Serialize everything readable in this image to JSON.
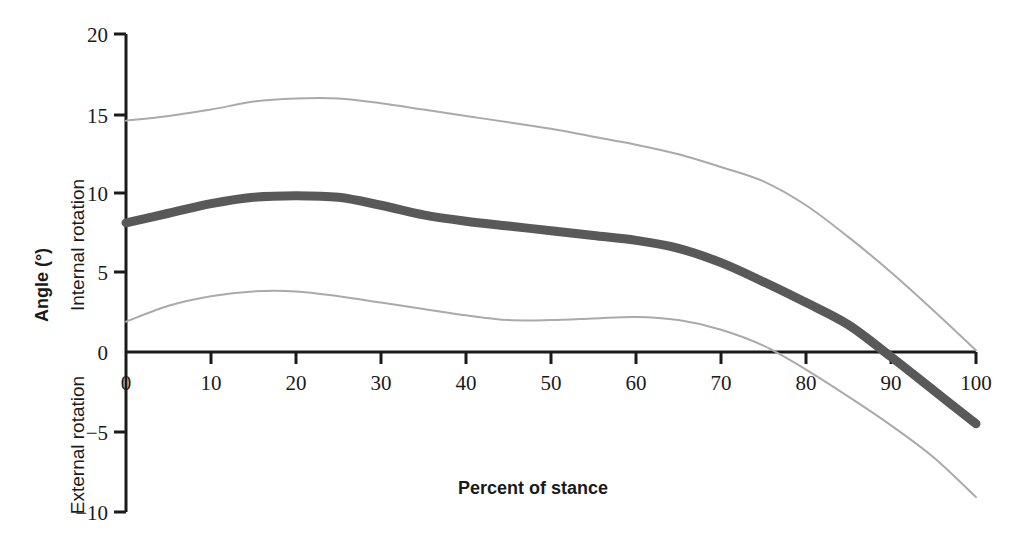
{
  "chart_data": {
    "type": "line",
    "title": "",
    "xlabel": "Percent of stance",
    "ylabel": "Angle (°)",
    "y_upper_region_label": "Internal rotation",
    "y_lower_region_label": "External rotation",
    "xlim": [
      0,
      100
    ],
    "ylim": [
      -10,
      20
    ],
    "xticks": [
      0,
      10,
      20,
      30,
      40,
      50,
      60,
      70,
      80,
      90,
      100
    ],
    "xtick_labels": [
      "0",
      "10",
      "20",
      "30",
      "40",
      "50",
      "60",
      "70",
      "80",
      "90",
      "100"
    ],
    "yticks": [
      -10,
      -5,
      0,
      5,
      10,
      15,
      20
    ],
    "ytick_labels": [
      "−10",
      "−5",
      "0",
      "5",
      "10",
      "15",
      "20"
    ],
    "grid": false,
    "legend": "none",
    "zero_line": true,
    "colors": {
      "mean": "#595959",
      "band": "#aaaaaa",
      "axis": "#1a1a1a"
    },
    "x": [
      0,
      5,
      10,
      15,
      20,
      25,
      30,
      35,
      40,
      45,
      50,
      55,
      60,
      65,
      70,
      75,
      80,
      85,
      90,
      95,
      100
    ],
    "series": [
      {
        "name": "Mean + 1 SD",
        "style": "thin",
        "color": "#aaaaaa",
        "values": [
          14.5,
          14.8,
          15.2,
          15.7,
          15.9,
          15.9,
          15.6,
          15.2,
          14.8,
          14.4,
          14.0,
          13.5,
          13.0,
          12.4,
          11.6,
          10.7,
          9.2,
          7.2,
          5.0,
          2.6,
          0.1
        ]
      },
      {
        "name": "Mean",
        "style": "thick",
        "color": "#595959",
        "values": [
          8.1,
          8.7,
          9.3,
          9.7,
          9.8,
          9.7,
          9.2,
          8.6,
          8.2,
          7.9,
          7.6,
          7.3,
          7.0,
          6.5,
          5.6,
          4.4,
          3.1,
          1.7,
          -0.3,
          -2.4,
          -4.5
        ]
      },
      {
        "name": "Mean − 1 SD",
        "style": "thin",
        "color": "#aaaaaa",
        "values": [
          1.9,
          2.9,
          3.5,
          3.8,
          3.8,
          3.5,
          3.1,
          2.7,
          2.3,
          2.0,
          2.0,
          2.1,
          2.2,
          2.0,
          1.4,
          0.4,
          -1.1,
          -2.8,
          -4.6,
          -6.6,
          -9.1
        ]
      }
    ]
  }
}
